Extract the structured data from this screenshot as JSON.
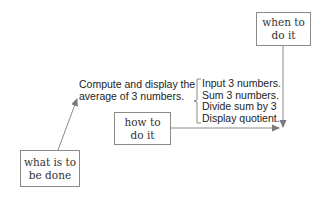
{
  "diagram": {
    "boxes": {
      "when": {
        "label": "when to\ndo it"
      },
      "how": {
        "label": "how to\ndo it"
      },
      "what": {
        "label": "what is to\nbe done"
      }
    },
    "goal": {
      "lines": [
        "Compute and display the",
        "average of 3 numbers."
      ]
    },
    "steps": [
      "Input 3 numbers.",
      "Sum 3 numbers.",
      "Divide sum by 3",
      "Display quotient."
    ],
    "colors": {
      "line": "#8a8a8a",
      "text": "#222222"
    }
  }
}
